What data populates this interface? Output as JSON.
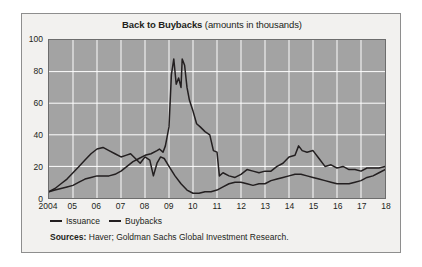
{
  "card": {
    "title_main": "Back to Buybacks",
    "title_sub": " (amounts in thousands)",
    "sources_label": "Sources:",
    "sources_text": " Haver; Goldman Sachs Global Investment Research.",
    "background_color": "#f2f1ef",
    "border_color": "#8e8e8e",
    "plot_background_color": "#a3a3a3",
    "gridline_color": "#ffffff",
    "line_color": "#231f20"
  },
  "chart_data": {
    "type": "line",
    "title": "Back to Buybacks (amounts in thousands)",
    "xlabel": "",
    "ylabel": "",
    "xlim": [
      2004,
      2018
    ],
    "ylim": [
      0,
      100
    ],
    "yticks": [
      0,
      20,
      40,
      60,
      80,
      100
    ],
    "ytick_labels": [
      "0",
      "20",
      "40",
      "60",
      "80",
      "100"
    ],
    "xticks": [
      2004,
      2005,
      2006,
      2007,
      2008,
      2009,
      2010,
      2011,
      2012,
      2013,
      2014,
      2015,
      2016,
      2017,
      2018
    ],
    "xtick_labels": [
      "2004",
      "05",
      "06",
      "07",
      "08",
      "09",
      "10",
      "11",
      "12",
      "13",
      "14",
      "15",
      "16",
      "17",
      "18"
    ],
    "grid": true,
    "grid_axis": "both",
    "legend_position": "below-axes-left",
    "series": [
      {
        "name": "Issuance",
        "color": "#231f20",
        "x": [
          2004.0,
          2004.25,
          2004.5,
          2004.75,
          2005.0,
          2005.25,
          2005.5,
          2005.75,
          2006.0,
          2006.25,
          2006.5,
          2006.75,
          2007.0,
          2007.25,
          2007.5,
          2007.75,
          2008.0,
          2008.25,
          2008.5,
          2008.6,
          2008.75,
          2008.85,
          2009.0,
          2009.1,
          2009.2,
          2009.3,
          2009.4,
          2009.5,
          2009.55,
          2009.65,
          2009.75,
          2009.85,
          2010.0,
          2010.15,
          2010.3,
          2010.5,
          2010.7,
          2010.85,
          2011.0,
          2011.1,
          2011.25,
          2011.5,
          2011.75,
          2012.0,
          2012.25,
          2012.5,
          2012.75,
          2013.0,
          2013.25,
          2013.5,
          2013.75,
          2014.0,
          2014.25,
          2014.4,
          2014.55,
          2014.75,
          2015.0,
          2015.25,
          2015.5,
          2015.75,
          2016.0,
          2016.25,
          2016.5,
          2016.75,
          2017.0,
          2017.25,
          2017.5,
          2017.75,
          2018.0
        ],
        "y": [
          4,
          5,
          6,
          7,
          8,
          10,
          12,
          13,
          14,
          14,
          14,
          15,
          17,
          20,
          23,
          25,
          27,
          28,
          30,
          31,
          29,
          33,
          45,
          78,
          88,
          72,
          76,
          70,
          88,
          84,
          70,
          62,
          55,
          47,
          45,
          42,
          40,
          30,
          29,
          14,
          16,
          14,
          13,
          15,
          18,
          17,
          16,
          17,
          17,
          20,
          22,
          26,
          27,
          33,
          30,
          29,
          30,
          25,
          20,
          21,
          19,
          20,
          18,
          18,
          17,
          19,
          19,
          19,
          20
        ]
      },
      {
        "name": "Buybacks",
        "color": "#231f20",
        "x": [
          2004.0,
          2004.25,
          2004.5,
          2004.75,
          2005.0,
          2005.25,
          2005.5,
          2005.75,
          2006.0,
          2006.25,
          2006.5,
          2006.75,
          2007.0,
          2007.2,
          2007.4,
          2007.6,
          2007.8,
          2008.0,
          2008.2,
          2008.35,
          2008.5,
          2008.65,
          2008.8,
          2009.0,
          2009.25,
          2009.5,
          2009.75,
          2010.0,
          2010.25,
          2010.5,
          2010.75,
          2011.0,
          2011.25,
          2011.5,
          2011.75,
          2012.0,
          2012.25,
          2012.5,
          2012.75,
          2013.0,
          2013.25,
          2013.5,
          2013.75,
          2014.0,
          2014.25,
          2014.5,
          2014.75,
          2015.0,
          2015.25,
          2015.5,
          2015.75,
          2016.0,
          2016.25,
          2016.5,
          2016.75,
          2017.0,
          2017.25,
          2017.5,
          2017.75,
          2018.0
        ],
        "y": [
          4,
          6,
          9,
          12,
          16,
          20,
          24,
          28,
          31,
          32,
          30,
          28,
          26,
          27,
          28,
          25,
          22,
          26,
          24,
          14,
          22,
          26,
          25,
          20,
          14,
          9,
          5,
          3,
          3,
          4,
          4,
          5,
          7,
          9,
          10,
          10,
          9,
          8,
          9,
          9,
          11,
          12,
          13,
          14,
          15,
          15,
          14,
          13,
          12,
          11,
          10,
          9,
          9,
          9,
          10,
          11,
          13,
          14,
          16,
          18
        ]
      }
    ]
  },
  "legend": {
    "items": [
      {
        "label": "Issuance"
      },
      {
        "label": "Buybacks"
      }
    ]
  }
}
